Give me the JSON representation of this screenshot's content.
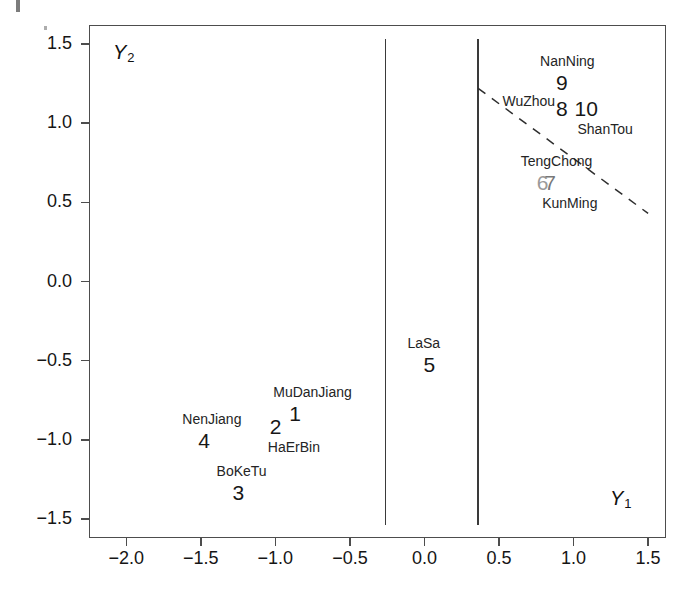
{
  "chart_data": {
    "type": "scatter",
    "title": "",
    "xlabel": "Y1",
    "ylabel": "Y2",
    "xlabel_display": "Y",
    "xlabel_sub": "1",
    "ylabel_display": "Y",
    "ylabel_sub": "2",
    "xlim": [
      -2.25,
      1.62
    ],
    "ylim": [
      -1.62,
      1.62
    ],
    "xticks": [
      "-2.0",
      "-1.5",
      "-1.0",
      "-0.5",
      "0.0",
      "0.5",
      "1.0",
      "1.5"
    ],
    "xtick_values": [
      -2.0,
      -1.5,
      -1.0,
      -0.5,
      0.0,
      0.5,
      1.0,
      1.5
    ],
    "yticks": [
      "1.5",
      "1.0",
      "0.5",
      "0.0",
      "-0.5",
      "-1.0",
      "-1.5"
    ],
    "ytick_values": [
      1.5,
      1.0,
      0.5,
      0.0,
      -0.5,
      -1.0,
      -1.5
    ],
    "grid": false,
    "legend": "none",
    "points": [
      {
        "id": "1",
        "name": "MuDanJiang",
        "x": -0.86,
        "y": -0.83,
        "label_pos": "above",
        "shade": "dark"
      },
      {
        "id": "2",
        "name": "HaErBin",
        "x": -0.99,
        "y": -0.92,
        "label_pos": "below",
        "shade": "dark"
      },
      {
        "id": "3",
        "name": "BoKeTu",
        "x": -1.24,
        "y": -1.33,
        "label_pos": "above",
        "shade": "dark"
      },
      {
        "id": "4",
        "name": "NenJiang",
        "x": -1.47,
        "y": -1.0,
        "label_pos": "above",
        "shade": "dark"
      },
      {
        "id": "5",
        "name": "LaSa",
        "x": 0.04,
        "y": -0.52,
        "label_pos": "above",
        "shade": "dark"
      },
      {
        "id": "6",
        "name": "TengChong",
        "x": 0.8,
        "y": 0.63,
        "label_pos": "above",
        "shade": "light"
      },
      {
        "id": "7",
        "name": "KunMing",
        "x": 0.85,
        "y": 0.62,
        "label_pos": "below",
        "shade": "mid"
      },
      {
        "id": "8",
        "name": "WuZhou",
        "x": 0.93,
        "y": 1.09,
        "label_pos": "left",
        "shade": "dark"
      },
      {
        "id": "9",
        "name": "NanNing",
        "x": 0.93,
        "y": 1.26,
        "label_pos": "above",
        "shade": "dark"
      },
      {
        "id": "10",
        "name": "ShanTou",
        "x": 1.08,
        "y": 1.09,
        "label_pos": "below-right",
        "shade": "dark"
      }
    ],
    "vertical_lines": [
      {
        "name": "left-partition",
        "x": -0.26
      },
      {
        "name": "right-partition",
        "x": 0.36
      }
    ],
    "dashed_line": {
      "name": "discriminant-boundary",
      "style": "dashed",
      "from": {
        "x": 0.36,
        "y": 1.22
      },
      "to": {
        "x": 1.5,
        "y": 0.43
      }
    }
  }
}
